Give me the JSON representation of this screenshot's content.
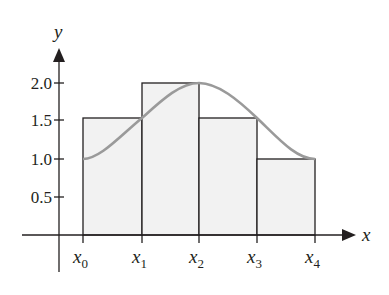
{
  "figure": {
    "y_axis_label": "y",
    "x_axis_label": "x",
    "y_ticks": [
      {
        "label": "2.0",
        "value": 2.0
      },
      {
        "label": "1.5",
        "value": 1.5
      },
      {
        "label": "1.0",
        "value": 1.0
      },
      {
        "label": "0.5",
        "value": 0.5
      }
    ],
    "x_ticks": [
      {
        "base": "x",
        "sub": "0"
      },
      {
        "base": "x",
        "sub": "1"
      },
      {
        "base": "x",
        "sub": "2"
      },
      {
        "base": "x",
        "sub": "3"
      },
      {
        "base": "x",
        "sub": "4"
      }
    ],
    "rectangles": [
      {
        "from": "x0",
        "to": "x1",
        "height": 1.5
      },
      {
        "from": "x1",
        "to": "x2",
        "height": 2.0
      },
      {
        "from": "x2",
        "to": "x3",
        "height": 1.5
      },
      {
        "from": "x3",
        "to": "x4",
        "height": 1.0
      }
    ],
    "curve": {
      "description": "smooth curve rising from 1.0 at x0 to 2.0 at x2 then falling to 1.0 at x4",
      "points": [
        [
          0,
          1.0
        ],
        [
          1,
          1.5
        ],
        [
          2,
          2.0
        ],
        [
          3,
          1.5
        ],
        [
          4,
          1.0
        ]
      ]
    },
    "colors": {
      "rect_fill": "#f2f2f2",
      "rect_stroke": "#231f20",
      "curve": "#9a9a9a",
      "axis": "#231f20"
    }
  }
}
